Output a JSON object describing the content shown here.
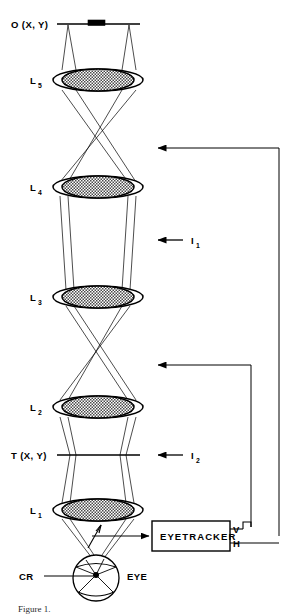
{
  "figure": {
    "caption": "Figure 1.",
    "colors": {
      "ink": "#000000",
      "lens_fill": "#b9b9b9",
      "paper": "#ffffff"
    }
  },
  "labels": {
    "object_plane": "O (X, Y)",
    "target_plane": "T (X, Y)",
    "lens5": "L",
    "lens5_sub": "5",
    "lens4": "L",
    "lens4_sub": "4",
    "lens3": "L",
    "lens3_sub": "3",
    "lens2": "L",
    "lens2_sub": "2",
    "lens1": "L",
    "lens1_sub": "1",
    "image1": "I",
    "image1_sub": "1",
    "image2": "I",
    "image2_sub": "2",
    "eyetracker": "EYETRACKER",
    "vertical_output": "V",
    "horizontal_output": "H",
    "corneal_reflection": "CR",
    "eye": "EYE"
  },
  "components": {
    "lenses": [
      {
        "name": "L5",
        "label": "L",
        "sub": "5",
        "cx": 98,
        "cy": 80,
        "rx": 45,
        "ry": 11
      },
      {
        "name": "L4",
        "label": "L",
        "sub": "4",
        "cx": 98,
        "cy": 187,
        "rx": 45,
        "ry": 11
      },
      {
        "name": "L3",
        "label": "L",
        "sub": "3",
        "cx": 98,
        "cy": 297,
        "rx": 45,
        "ry": 11
      },
      {
        "name": "L2",
        "label": "L",
        "sub": "2",
        "cx": 98,
        "cy": 407,
        "rx": 45,
        "ry": 11
      },
      {
        "name": "L1",
        "label": "L",
        "sub": "1",
        "cx": 98,
        "cy": 510,
        "rx": 45,
        "ry": 11
      }
    ],
    "planes": [
      {
        "name": "object-plane",
        "label": "O (X, Y)",
        "y": 24,
        "x1": 57,
        "x2": 140
      },
      {
        "name": "target-plane",
        "label": "T (X, Y)",
        "y": 455,
        "x1": 57,
        "x2": 140
      }
    ],
    "image_markers": [
      {
        "name": "I1",
        "label": "I",
        "sub": "1",
        "arrow_y": 240,
        "arrow_x1": 183,
        "arrow_x2": 155
      },
      {
        "name": "I2",
        "label": "I",
        "sub": "2",
        "arrow_y": 455,
        "arrow_x1": 183,
        "arrow_x2": 155
      }
    ],
    "feedback_lines": [
      {
        "name": "feedback-upper",
        "arrow_y": 148,
        "arrow_x": 155,
        "corner_x": 279
      },
      {
        "name": "feedback-lower",
        "arrow_y": 365,
        "arrow_x": 155,
        "corner_x": 251
      }
    ],
    "eyetracker_box": {
      "x": 152,
      "y": 521,
      "w": 78,
      "h": 30
    },
    "eye": {
      "cx": 96,
      "cy": 578,
      "r": 23
    }
  }
}
